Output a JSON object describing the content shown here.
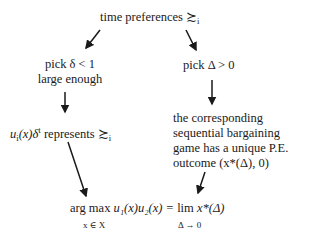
{
  "nodes": {
    "top": {
      "text": "time preferences",
      "symbol": "≿",
      "subscript": "i"
    },
    "left1": {
      "line1": "pick δ < 1",
      "line2": "large enough"
    },
    "right1": {
      "text": "pick Δ > 0"
    },
    "left2": {
      "u": "u",
      "sub": "i",
      "rest": "(x)δ",
      "sup": "t",
      "text": " represents ",
      "symbol": "≿",
      "subscript": "i"
    },
    "right2": {
      "lines": [
        "the corresponding",
        "sequential bargaining",
        "game has a unique P.E.",
        "outcome (x*(Δ), 0)"
      ]
    },
    "bottom": {
      "argmax": "arg max",
      "argmax_sub": "x ∈ X",
      "expr": "u₁(x)u₂(x) =",
      "lim": "lim",
      "lim_sub": "Δ → 0",
      "limexpr": "x*(Δ)"
    }
  },
  "edges": [
    {
      "from": "top",
      "to": "left1"
    },
    {
      "from": "top",
      "to": "right1"
    },
    {
      "from": "left1",
      "to": "left2"
    },
    {
      "from": "right1",
      "to": "right2"
    },
    {
      "from": "left2",
      "to": "bottom"
    },
    {
      "from": "right2",
      "to": "bottom"
    }
  ]
}
